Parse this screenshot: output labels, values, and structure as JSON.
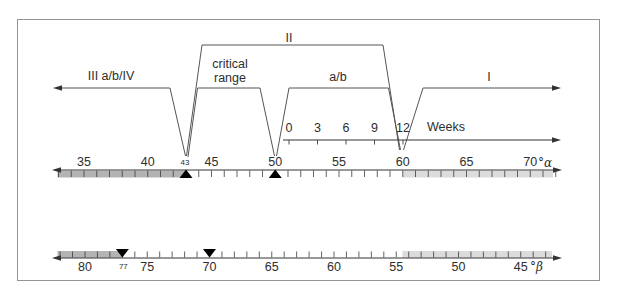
{
  "brackets": {
    "iii": "III a/b/IV",
    "ii": "II",
    "critical_line1": "critical",
    "critical_line2": "range",
    "ab": "a/b",
    "i": "I"
  },
  "weeks": {
    "label": "Weeks",
    "ticks": [
      0,
      3,
      6,
      9,
      12
    ]
  },
  "alpha": {
    "unit": "°α",
    "labels": [
      35,
      40,
      45,
      50,
      55,
      60,
      65,
      70
    ],
    "minor_label": 43,
    "tick_min": 33,
    "tick_max": 72,
    "shaded_dark_to": 43,
    "shaded_light_from": 60,
    "markers": [
      43,
      50
    ]
  },
  "beta": {
    "unit": "°β",
    "labels": [
      80,
      75,
      70,
      65,
      60,
      55,
      50,
      45
    ],
    "minor_label": 77,
    "tick_min": 43,
    "tick_max": 82,
    "shaded_dark_from": 77,
    "shaded_light_to": 54.5,
    "markers": [
      77,
      70
    ]
  },
  "colors": {
    "band_dark": "#b3b3b3",
    "band_light": "#dcdcdc",
    "axis": "#333333",
    "bracket": "#555555",
    "tick": "#3a3a3a",
    "marker": "#000000",
    "text": "#2e2e2e",
    "frame": "#949494"
  }
}
